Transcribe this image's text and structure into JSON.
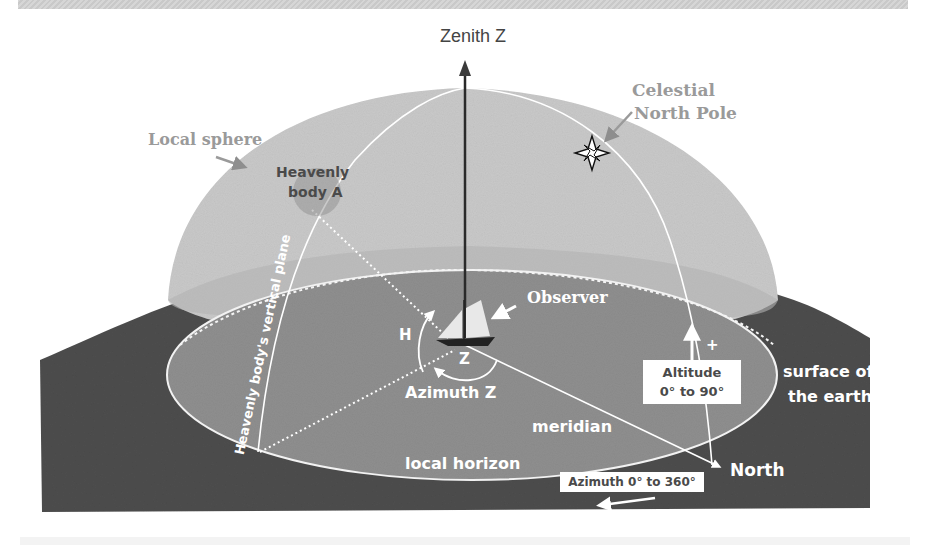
{
  "diagram": {
    "title": "Zenith Z",
    "labels": {
      "zenith": "Zenith Z",
      "celestial_pole_line1": "Celestial",
      "celestial_pole_line2": "North Pole",
      "local_sphere": "Local sphere",
      "heavenly_body_line1": "Heavenly",
      "heavenly_body_line2": "body A",
      "vertical_plane": "Heavenly body's vertical plane",
      "observer": "Observer",
      "h_angle": "H",
      "z_angle": "Z",
      "azimuth_z": "Azimuth Z",
      "meridian": "meridian",
      "local_horizon": "local horizon",
      "north": "North",
      "altitude_line1": "Altitude",
      "altitude_line2": "0° to 90°",
      "altitude_plus": "+",
      "surface_line1": "surface of",
      "surface_line2": "the earth",
      "azimuth_range": "Azimuth 0° to 360°"
    },
    "colors": {
      "earth": "#4d4d4d",
      "sphere": "#c8c8c8",
      "horizon_disc": "#8e8e8e",
      "line_white": "#ffffff",
      "label_gray": "#9a9a9a",
      "label_dark": "#4a4a4a"
    }
  }
}
